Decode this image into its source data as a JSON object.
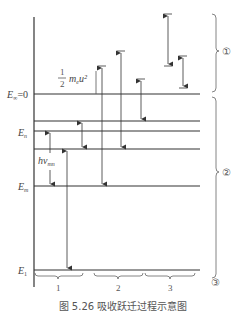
{
  "figure": {
    "caption": "图 5.26   吸收跃迁过程示意图",
    "colors": {
      "line": "#333333",
      "text": "#555555",
      "background": "#ffffff"
    }
  },
  "levels": [
    {
      "id": "E_inf",
      "label": "E",
      "sub": "∞",
      "suffix": "=0",
      "y": 94
    },
    {
      "id": "E_a",
      "label": "",
      "sub": "",
      "suffix": "",
      "y": 121
    },
    {
      "id": "E_n",
      "label": "E",
      "sub": "n",
      "suffix": "",
      "y": 131
    },
    {
      "id": "E_b",
      "label": "",
      "sub": "",
      "suffix": "",
      "y": 149
    },
    {
      "id": "E_m",
      "label": "E",
      "sub": "m",
      "suffix": "",
      "y": 186
    },
    {
      "id": "E_1",
      "label": "E",
      "sub": "1",
      "suffix": "",
      "y": 270
    }
  ],
  "annotations": {
    "kinetic_energy": {
      "frac_num": "1",
      "frac_den": "2",
      "expr": "m",
      "sub": "e",
      "tail": "u²"
    },
    "photon": {
      "h": "h",
      "nu": "ν",
      "sub": "mn"
    }
  },
  "regions_right": [
    {
      "label": "①",
      "y_top": 14,
      "y_bottom": 92
    },
    {
      "label": "②",
      "y_top": 97,
      "y_bottom": 278
    },
    {
      "label": "③"
    }
  ],
  "groups_bottom": [
    {
      "label": "1",
      "x_start": 35,
      "x_end": 83
    },
    {
      "label": "2",
      "x_start": 94,
      "x_end": 143
    },
    {
      "label": "3",
      "x_start": 145,
      "x_end": 195
    }
  ]
}
